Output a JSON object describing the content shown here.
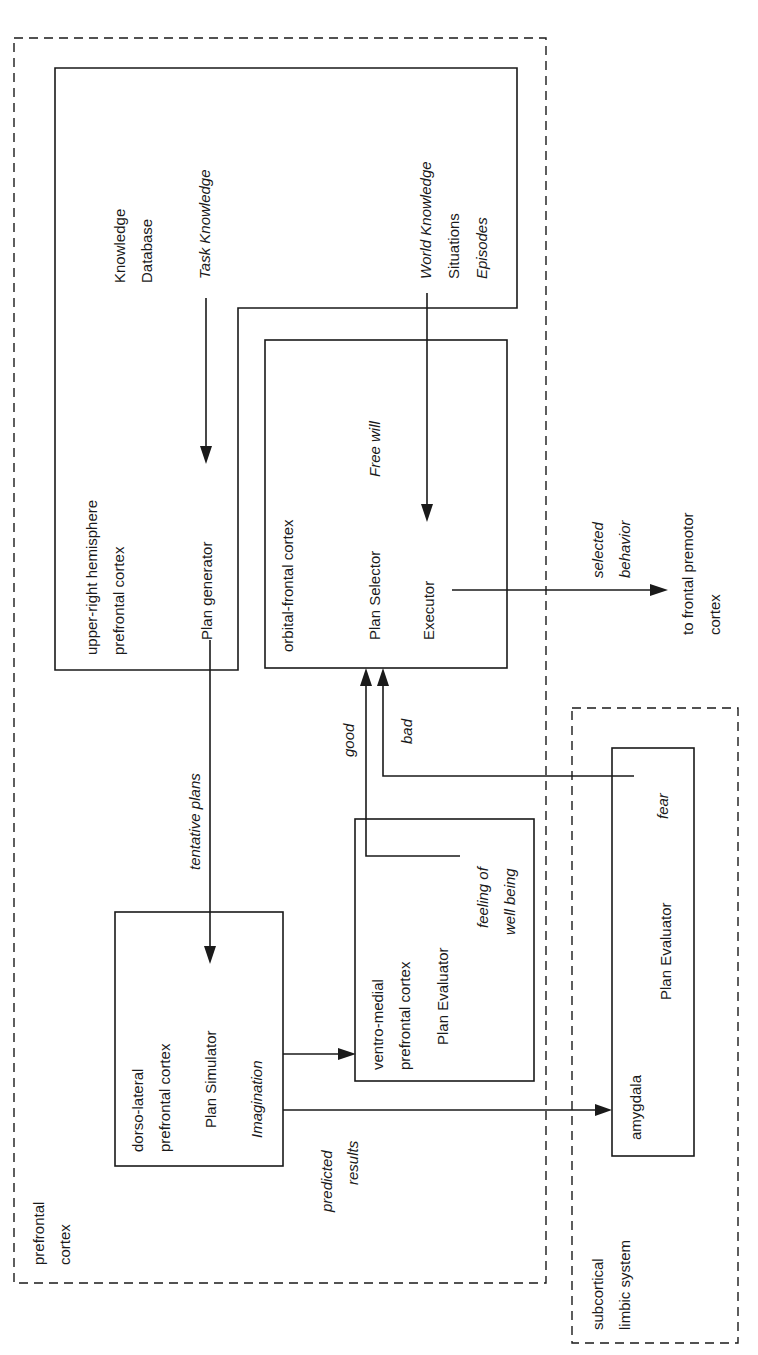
{
  "regions": {
    "prefrontal": [
      "prefrontal",
      "cortex"
    ],
    "limbic": [
      "subcortical",
      "limbic system"
    ]
  },
  "knowledge_box": {
    "title": [
      "Knowledge",
      "Database"
    ],
    "task": "Task Knowledge",
    "world": [
      "World Knowledge",
      "Situations",
      "Episodes"
    ],
    "area": [
      "upper-right hemisphere",
      "prefrontal cortex"
    ],
    "module": "Plan generator"
  },
  "orbital_box": {
    "area": "orbital-frontal cortex",
    "module": "Plan Selector",
    "note": "Free will",
    "executor": "Executor"
  },
  "dorsolateral_box": {
    "area": [
      "dorso-lateral",
      "prefrontal cortex"
    ],
    "module": "Plan Simulator",
    "note": "Imagination"
  },
  "ventromedial_box": {
    "area": [
      "ventro-medial",
      "prefrontal cortex"
    ],
    "module": "Plan Evaluator",
    "note": [
      "feeling of",
      "well being"
    ]
  },
  "amygdala_box": {
    "area": "amygdala",
    "module": "Plan Evaluator",
    "note": "fear"
  },
  "edges": {
    "tentative": "tentative plans",
    "good": "good",
    "bad": "bad",
    "predicted": [
      "predicted",
      "results"
    ],
    "selected": [
      "selected",
      "behavior"
    ],
    "output": [
      "to frontal premotor",
      "cortex"
    ]
  },
  "colors": {
    "ink": "#1a1a1a",
    "background": "#ffffff"
  }
}
